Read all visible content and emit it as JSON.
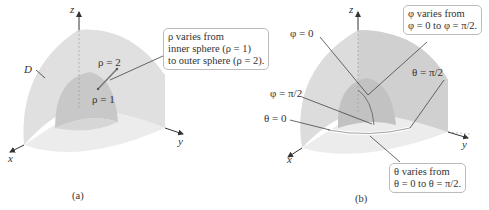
{
  "panel_a": {
    "caption": "(a)",
    "axes": {
      "x": "x",
      "y": "y",
      "z": "z"
    },
    "region_label": "D",
    "rho_outer_label": "ρ = 2",
    "rho_inner_label": "ρ = 1",
    "callout": {
      "line1": "ρ varies from",
      "line2": "inner sphere (ρ = 1)",
      "line3": "to outer sphere (ρ = 2)."
    }
  },
  "panel_b": {
    "caption": "(b)",
    "axes": {
      "x": "x",
      "y": "y",
      "z": "z"
    },
    "phi_zero_label": "φ = 0",
    "phi_half_pi_label": "φ = π/2",
    "theta_zero_label": "θ = 0",
    "theta_half_pi_label": "θ = π/2",
    "phi_callout": {
      "line1": "φ varies from",
      "line2": "φ = 0 to φ = π/2."
    },
    "theta_callout": {
      "line1": "θ varies from",
      "line2": "θ = 0 to θ = π/2."
    }
  },
  "colors": {
    "outer_shell": "#e2e2e2",
    "inner_shell": "#c9c9c9",
    "base": "#ececec",
    "axis": "#333333",
    "box_border": "#bbbbbb"
  }
}
